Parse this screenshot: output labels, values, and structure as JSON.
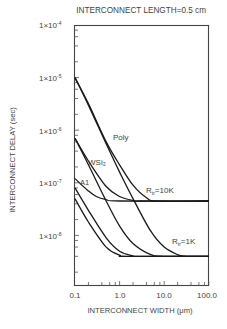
{
  "chart_data": {
    "type": "line",
    "title": "INTERCONNECT LENGTH=0.5 cm",
    "xlabel": "INTERCONNECT WIDTH (μm)",
    "ylabel": "INTERCONNECT DELAY (sec)",
    "xscale": "log",
    "yscale": "log",
    "xlim": [
      0.1,
      100.0
    ],
    "ylim": [
      1.2e-09,
      0.0001
    ],
    "x_ticks": [
      "0.1",
      "1.0",
      "10.0",
      "100.0"
    ],
    "y_ticks": [
      "1×10⁻⁴",
      "1×10⁻⁵",
      "1×10⁻⁶",
      "1×10⁻⁷",
      "1×10⁻⁸"
    ],
    "grid": false,
    "annotations": [
      "Poly",
      "WSi₂",
      "A1",
      "Rᵣ=10K",
      "Rᵣ=1K"
    ],
    "series": [
      {
        "name": "Poly, Rtr=10K",
        "x": [
          0.1,
          0.2,
          0.5,
          1.0,
          2.0,
          4.0,
          7.0,
          100.0
        ],
        "y": [
          1e-05,
          3.2e-06,
          6e-07,
          2.2e-07,
          9e-08,
          5.2e-08,
          4.5e-08,
          4.5e-08
        ]
      },
      {
        "name": "Poly, Rtr=1K",
        "x": [
          0.1,
          0.2,
          0.5,
          1.0,
          2.0,
          5.0,
          10.0,
          20.0,
          30.0,
          100.0
        ],
        "y": [
          1e-05,
          3e-06,
          5.5e-07,
          1.6e-07,
          5e-08,
          1.2e-08,
          6e-09,
          4.3e-09,
          4e-09,
          4e-09
        ]
      },
      {
        "name": "WSi2, Rtr=10K",
        "x": [
          0.1,
          0.2,
          0.5,
          1.0,
          2.0,
          3.0,
          100.0
        ],
        "y": [
          7e-07,
          2.6e-07,
          8.5e-08,
          5.5e-08,
          4.6e-08,
          4.5e-08,
          4.5e-08
        ]
      },
      {
        "name": "WSi2, Rtr=1K",
        "x": [
          0.1,
          0.2,
          0.5,
          1.0,
          2.0,
          5.0,
          10.0,
          100.0
        ],
        "y": [
          7e-07,
          2.2e-07,
          4.5e-08,
          1.5e-08,
          7e-09,
          4.3e-09,
          4e-09,
          4e-09
        ]
      },
      {
        "name": "A1, Rtr=10K",
        "x": [
          0.1,
          0.2,
          0.3,
          0.5,
          1.0,
          100.0
        ],
        "y": [
          1.2e-07,
          7e-08,
          5.5e-08,
          4.8e-08,
          4.5e-08,
          4.5e-08
        ]
      },
      {
        "name": "A1, Rtr=1K",
        "x": [
          0.1,
          0.2,
          0.5,
          1.0,
          2.0,
          3.0,
          100.0
        ],
        "y": [
          8e-08,
          3e-08,
          9e-09,
          5e-09,
          4.1e-09,
          4e-09,
          4e-09
        ]
      },
      {
        "name": "Cu, Rtr=1K",
        "x": [
          0.1,
          0.2,
          0.5,
          1.0,
          1.5,
          100.0
        ],
        "y": [
          5e-08,
          1.8e-08,
          6e-09,
          4.2e-09,
          4e-09,
          4e-09
        ]
      }
    ]
  },
  "labels": {
    "title": "INTERCONNECT LENGTH=0.5 cm",
    "xlabel": "INTERCONNECT WIDTH (μm)",
    "ylabel": "INTERCONNECT DELAY (sec)",
    "poly": "Poly",
    "wsi2": "WSi₂",
    "al": "A1",
    "r10k": "R",
    "r10k_sub": "tr",
    "r10k_val": "=10K",
    "r1k": "R",
    "r1k_sub": "tr",
    "r1k_val": "=1K",
    "xt0": "0.1",
    "xt1": "1.0",
    "xt2": "10.0",
    "xt3": "100.0",
    "yt_base": "1×10",
    "yt0": "-4",
    "yt1": "-5",
    "yt2": "-6",
    "yt3": "-7",
    "yt4": "-8"
  }
}
